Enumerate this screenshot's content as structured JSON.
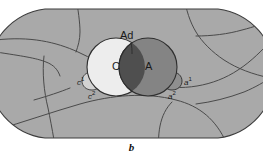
{
  "figure": {
    "caption": "b",
    "type": "anatomical-cell-diagram"
  },
  "labels": {
    "ad": "Ad",
    "c_circle": "C",
    "a_circle": "A",
    "c1": "c",
    "c1_sup": "1",
    "c2": "c",
    "c2_sup": "2",
    "a1": "a",
    "a1_sup": "1",
    "a2": "a",
    "a2_sup": "2"
  },
  "colors": {
    "field_fill": "#a9a9a9",
    "field_stroke": "#3c3c3c",
    "boundary_line": "#4a4a4a",
    "circle_c_fill": "#ededed",
    "circle_a_fill": "#848484",
    "lens_fill": "#4f4f4f",
    "lobe_fill": "#cfcfcf",
    "label_color": "#1a1a1a",
    "background": "#ffffff"
  }
}
